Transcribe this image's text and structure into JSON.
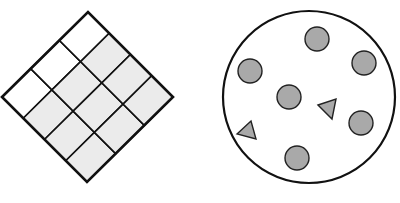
{
  "figure": {
    "width": 400,
    "height": 203,
    "background": "#ffffff",
    "stroke_color": "#111111",
    "shade_color": "#ebebeb",
    "marker_fill": "#a9a9a9",
    "marker_stroke": "#222222"
  },
  "grid_diamond": {
    "description": "Rotated 3x4 rectangular grid; 3 of 12 cells white, 9 shaded",
    "vertices": {
      "left": [
        2,
        97
      ],
      "top": [
        88,
        12
      ],
      "right": [
        173,
        97
      ],
      "bottom": [
        87,
        180
      ]
    },
    "divisions_u": 3,
    "divisions_v": 4,
    "total_cells": 12,
    "white_cells": 3,
    "shaded_cells": 9,
    "white_row_index": 0
  },
  "circle_set": {
    "description": "Large circle containing 6 gray dots and 2 gray triangles",
    "outline": {
      "cx": 309,
      "cy": 97,
      "r": 86
    },
    "dots": [
      {
        "cx": 317,
        "cy": 39,
        "r": 12
      },
      {
        "cx": 364,
        "cy": 63,
        "r": 12
      },
      {
        "cx": 250,
        "cy": 71,
        "r": 12
      },
      {
        "cx": 289,
        "cy": 97,
        "r": 12
      },
      {
        "cx": 361,
        "cy": 123,
        "r": 12
      },
      {
        "cx": 297,
        "cy": 158,
        "r": 12
      }
    ],
    "triangles": [
      {
        "points": [
          [
            318,
            105
          ],
          [
            336,
            99
          ],
          [
            332,
            119
          ]
        ]
      },
      {
        "points": [
          [
            237,
            134
          ],
          [
            251,
            121
          ],
          [
            256,
            139
          ]
        ]
      }
    ],
    "dot_count": 6,
    "triangle_count": 2
  }
}
